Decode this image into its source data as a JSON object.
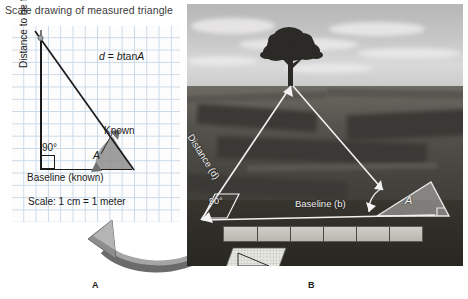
{
  "figure": {
    "panel_a_caption": "A",
    "panel_b_caption": "B"
  },
  "panel_a": {
    "title": "Scale drawing of measured triangle",
    "formula": "d = b tan A",
    "formula_parts": {
      "d": "d",
      "eq": "=",
      "b": "b",
      "tan": "tan",
      "A": "A"
    },
    "y_axis_label": "Distance to be found",
    "baseline_label": "Baseline (known)",
    "right_angle": "90°",
    "angle_label": "A",
    "known_label": "Known",
    "scale_note": "Scale: 1 cm = 1 meter",
    "grid_color": "#c9d9e8",
    "paper_color": "#fdfdfd",
    "line_color": "#1b1b1b",
    "angle_fill_color": "#8d8d8d"
  },
  "panel_b": {
    "distance_label": "Distance (d)",
    "baseline_label": "Baseline (b)",
    "right_angle": "90°",
    "angle_label": "A",
    "overlay_color": "#f2f2f2",
    "sky_color": "#c8c8c8",
    "hill_color": "#55534d",
    "foreground_color": "#2e2c27",
    "tape_color": "#cfcdc6",
    "tape_tick_count": 5,
    "triangle_fill": "rgba(225,225,225,0.45)"
  },
  "connector": {
    "arrow_color": "#8a8a8a",
    "arrow_color_dark": "#6b6b6b"
  }
}
